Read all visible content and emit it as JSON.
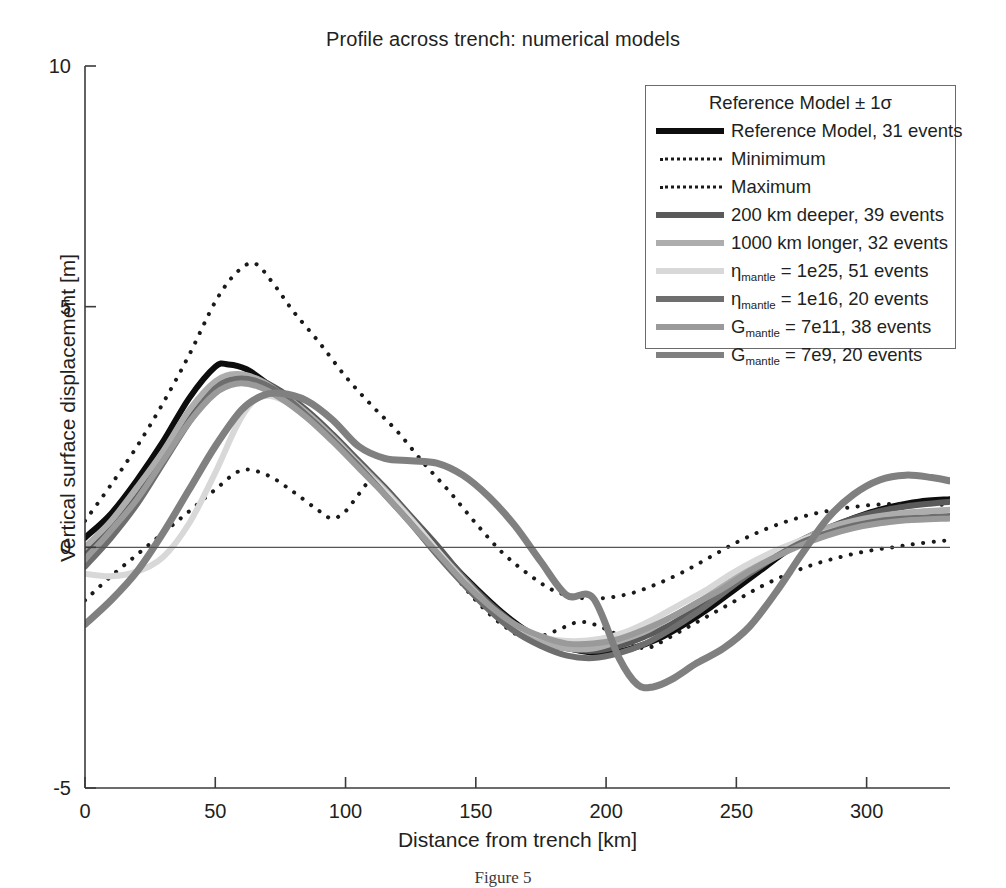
{
  "title": "Profile across trench: numerical models",
  "caption": "Figure 5",
  "axes": {
    "x_label": "Distance from trench [km]",
    "y_label": "Vertical surface displacement [m]",
    "x_ticks": [
      "0",
      "50",
      "100",
      "150",
      "200",
      "250",
      "300"
    ],
    "y_ticks": [
      "10",
      "5",
      "0",
      "-5"
    ]
  },
  "legend": {
    "header": "Reference Model ± 1σ",
    "items": [
      {
        "label_html": "Reference Model, 31 events",
        "style": "solid",
        "color": "#0d0d0d",
        "width": 6
      },
      {
        "label_html": "Minimimum",
        "style": "dotted",
        "color": "#1a1a1a",
        "width": 3
      },
      {
        "label_html": "Maximum",
        "style": "dotted",
        "color": "#1a1a1a",
        "width": 3
      },
      {
        "label_html": "200 km deeper, 39 events",
        "style": "solid",
        "color": "#5a5a5a",
        "width": 6
      },
      {
        "label_html": "1000 km longer, 32 events",
        "style": "solid",
        "color": "#adadad",
        "width": 6
      },
      {
        "label_html": "η<sub>mantle</sub> = 1e25, 51 events",
        "style": "solid",
        "color": "#d8d8d8",
        "width": 6
      },
      {
        "label_html": "η<sub>mantle</sub> = 1e16, 20 events",
        "style": "solid",
        "color": "#6e6e6e",
        "width": 6
      },
      {
        "label_html": "G<sub>mantle</sub> = 7e11, 38 events",
        "style": "solid",
        "color": "#9a9a9a",
        "width": 6
      },
      {
        "label_html": "G<sub>mantle</sub> = 7e9, 20 events",
        "style": "solid",
        "color": "#808080",
        "width": 6
      }
    ]
  },
  "chart_data": {
    "type": "line",
    "title": "Profile across trench: numerical models",
    "xlabel": "Distance from trench [km]",
    "ylabel": "Vertical surface displacement [m]",
    "xlim": [
      0,
      332
    ],
    "ylim": [
      -5,
      10
    ],
    "grid": false,
    "zero_line": true,
    "legend_position": "upper-right",
    "series": [
      {
        "name": "Reference Model, 31 events",
        "color": "#0d0d0d",
        "style": "solid",
        "width": 6,
        "x": [
          0,
          10,
          20,
          30,
          40,
          50,
          55,
          62,
          70,
          80,
          90,
          100,
          110,
          120,
          130,
          140,
          150,
          160,
          170,
          180,
          190,
          200,
          210,
          220,
          230,
          240,
          250,
          260,
          270,
          280,
          290,
          300,
          310,
          320,
          332
        ],
        "y": [
          0.2,
          0.7,
          1.4,
          2.2,
          3.1,
          3.75,
          3.8,
          3.7,
          3.4,
          3.0,
          2.5,
          2.0,
          1.4,
          0.85,
          0.3,
          -0.3,
          -0.85,
          -1.35,
          -1.75,
          -2.0,
          -2.15,
          -2.2,
          -2.1,
          -1.9,
          -1.6,
          -1.25,
          -0.85,
          -0.45,
          -0.05,
          0.25,
          0.5,
          0.7,
          0.85,
          0.95,
          1.0
        ]
      },
      {
        "name": "Minimimum",
        "color": "#1a1a1a",
        "style": "dotted",
        "width": 4,
        "x": [
          0,
          10,
          20,
          30,
          40,
          50,
          60,
          70,
          80,
          90,
          95,
          100,
          105,
          110,
          115,
          120,
          130,
          140,
          150,
          160,
          170,
          180,
          190,
          200,
          210,
          215,
          220,
          230,
          240,
          250,
          260,
          270,
          280,
          290,
          300,
          310,
          320,
          332
        ],
        "y": [
          -1.1,
          -0.6,
          -0.15,
          0.3,
          0.75,
          1.2,
          1.6,
          1.5,
          1.15,
          0.75,
          0.6,
          0.75,
          1.1,
          1.4,
          1.25,
          0.95,
          0.25,
          -0.45,
          -1.1,
          -1.6,
          -1.9,
          -1.75,
          -1.55,
          -1.7,
          -2.0,
          -2.1,
          -2.0,
          -1.7,
          -1.4,
          -1.1,
          -0.8,
          -0.55,
          -0.35,
          -0.2,
          -0.08,
          0.0,
          0.08,
          0.15
        ]
      },
      {
        "name": "Maximum",
        "color": "#1a1a1a",
        "style": "dotted",
        "width": 4,
        "x": [
          0,
          10,
          20,
          30,
          40,
          50,
          58,
          65,
          72,
          80,
          90,
          100,
          110,
          120,
          130,
          140,
          150,
          160,
          170,
          180,
          190,
          200,
          210,
          220,
          230,
          240,
          250,
          260,
          270,
          280,
          290,
          300,
          310,
          320,
          332
        ],
        "y": [
          0.55,
          1.3,
          2.1,
          3.0,
          4.0,
          5.1,
          5.7,
          5.9,
          5.5,
          4.9,
          4.25,
          3.55,
          2.95,
          2.4,
          1.75,
          1.15,
          0.5,
          -0.1,
          -0.55,
          -0.9,
          -1.05,
          -1.05,
          -0.95,
          -0.75,
          -0.5,
          -0.2,
          0.1,
          0.35,
          0.55,
          0.7,
          0.8,
          0.87,
          0.9,
          0.9,
          0.88
        ]
      },
      {
        "name": "200 km deeper, 39 events",
        "color": "#5a5a5a",
        "style": "solid",
        "width": 6,
        "x": [
          0,
          10,
          20,
          30,
          40,
          50,
          58,
          66,
          75,
          85,
          95,
          105,
          115,
          125,
          135,
          145,
          155,
          165,
          175,
          185,
          195,
          205,
          215,
          225,
          235,
          245,
          255,
          265,
          275,
          285,
          295,
          305,
          315,
          332
        ],
        "y": [
          -0.15,
          0.4,
          1.05,
          1.85,
          2.7,
          3.35,
          3.55,
          3.5,
          3.25,
          2.85,
          2.35,
          1.8,
          1.25,
          0.65,
          0.05,
          -0.6,
          -1.15,
          -1.6,
          -1.95,
          -2.1,
          -2.15,
          -2.05,
          -1.85,
          -1.6,
          -1.25,
          -0.9,
          -0.5,
          -0.15,
          0.15,
          0.4,
          0.6,
          0.75,
          0.85,
          0.95
        ]
      },
      {
        "name": "1000 km longer, 32 events",
        "color": "#adadad",
        "style": "solid",
        "width": 6,
        "x": [
          0,
          10,
          20,
          30,
          40,
          50,
          58,
          66,
          75,
          85,
          95,
          105,
          115,
          125,
          135,
          145,
          155,
          165,
          175,
          185,
          195,
          205,
          215,
          225,
          235,
          245,
          255,
          265,
          275,
          285,
          295,
          305,
          315,
          332
        ],
        "y": [
          0.0,
          0.55,
          1.25,
          2.0,
          2.85,
          3.45,
          3.6,
          3.5,
          3.2,
          2.8,
          2.3,
          1.75,
          1.2,
          0.6,
          -0.05,
          -0.65,
          -1.2,
          -1.65,
          -1.95,
          -2.1,
          -2.1,
          -1.95,
          -1.75,
          -1.45,
          -1.15,
          -0.8,
          -0.45,
          -0.1,
          0.15,
          0.4,
          0.55,
          0.65,
          0.72,
          0.78
        ]
      },
      {
        "name": "eta_mantle = 1e25, 51 events",
        "color": "#d8d8d8",
        "style": "solid",
        "width": 6,
        "x": [
          0,
          10,
          20,
          30,
          40,
          50,
          58,
          64,
          70,
          78,
          88,
          98,
          108,
          118,
          128,
          138,
          148,
          158,
          168,
          178,
          188,
          198,
          208,
          218,
          228,
          238,
          248,
          258,
          268,
          278,
          288,
          298,
          308,
          318,
          332
        ],
        "y": [
          -0.55,
          -0.6,
          -0.5,
          -0.2,
          0.5,
          1.55,
          2.5,
          3.0,
          3.15,
          3.0,
          2.6,
          2.1,
          1.55,
          1.0,
          0.4,
          -0.25,
          -0.85,
          -1.35,
          -1.7,
          -1.9,
          -1.95,
          -1.9,
          -1.75,
          -1.5,
          -1.2,
          -0.9,
          -0.55,
          -0.25,
          0.0,
          0.2,
          0.35,
          0.45,
          0.52,
          0.58,
          0.62
        ]
      },
      {
        "name": "eta_mantle = 1e16, 20 events",
        "color": "#6e6e6e",
        "style": "solid",
        "width": 6,
        "x": [
          0,
          10,
          20,
          30,
          40,
          50,
          58,
          66,
          75,
          85,
          95,
          105,
          115,
          125,
          135,
          145,
          155,
          165,
          175,
          185,
          195,
          205,
          215,
          225,
          235,
          245,
          255,
          265,
          275,
          285,
          295,
          305,
          315,
          332
        ],
        "y": [
          -0.4,
          0.2,
          0.9,
          1.75,
          2.6,
          3.3,
          3.5,
          3.45,
          3.2,
          2.75,
          2.25,
          1.7,
          1.1,
          0.5,
          -0.15,
          -0.75,
          -1.3,
          -1.75,
          -2.05,
          -2.25,
          -2.3,
          -2.2,
          -2.0,
          -1.7,
          -1.35,
          -0.95,
          -0.55,
          -0.2,
          0.1,
          0.3,
          0.45,
          0.55,
          0.6,
          0.65
        ]
      },
      {
        "name": "G_mantle = 7e11, 38 events",
        "color": "#9a9a9a",
        "style": "solid",
        "width": 6,
        "x": [
          0,
          10,
          20,
          30,
          40,
          50,
          58,
          66,
          75,
          85,
          95,
          105,
          115,
          125,
          135,
          145,
          155,
          165,
          175,
          185,
          195,
          205,
          215,
          225,
          235,
          245,
          255,
          265,
          275,
          285,
          295,
          305,
          315,
          332
        ],
        "y": [
          -0.25,
          0.35,
          1.0,
          1.8,
          2.6,
          3.2,
          3.4,
          3.35,
          3.1,
          2.7,
          2.2,
          1.65,
          1.1,
          0.5,
          -0.1,
          -0.7,
          -1.2,
          -1.6,
          -1.85,
          -2.0,
          -2.0,
          -1.9,
          -1.7,
          -1.45,
          -1.15,
          -0.85,
          -0.5,
          -0.2,
          0.05,
          0.25,
          0.4,
          0.5,
          0.56,
          0.6
        ]
      },
      {
        "name": "G_mantle = 7e9, 20 events",
        "color": "#808080",
        "style": "solid",
        "width": 7,
        "x": [
          0,
          10,
          20,
          30,
          40,
          50,
          60,
          68,
          75,
          85,
          95,
          105,
          115,
          125,
          135,
          145,
          155,
          165,
          175,
          185,
          195,
          205,
          212,
          218,
          225,
          235,
          245,
          255,
          265,
          275,
          285,
          295,
          305,
          315,
          325,
          332
        ],
        "y": [
          -1.6,
          -1.1,
          -0.5,
          0.3,
          1.2,
          2.1,
          2.85,
          3.15,
          3.2,
          3.05,
          2.65,
          2.1,
          1.85,
          1.8,
          1.75,
          1.5,
          1.05,
          0.45,
          -0.3,
          -1.0,
          -1.05,
          -2.3,
          -2.85,
          -2.9,
          -2.75,
          -2.4,
          -2.1,
          -1.65,
          -0.95,
          -0.15,
          0.6,
          1.1,
          1.4,
          1.5,
          1.45,
          1.38
        ]
      }
    ]
  }
}
